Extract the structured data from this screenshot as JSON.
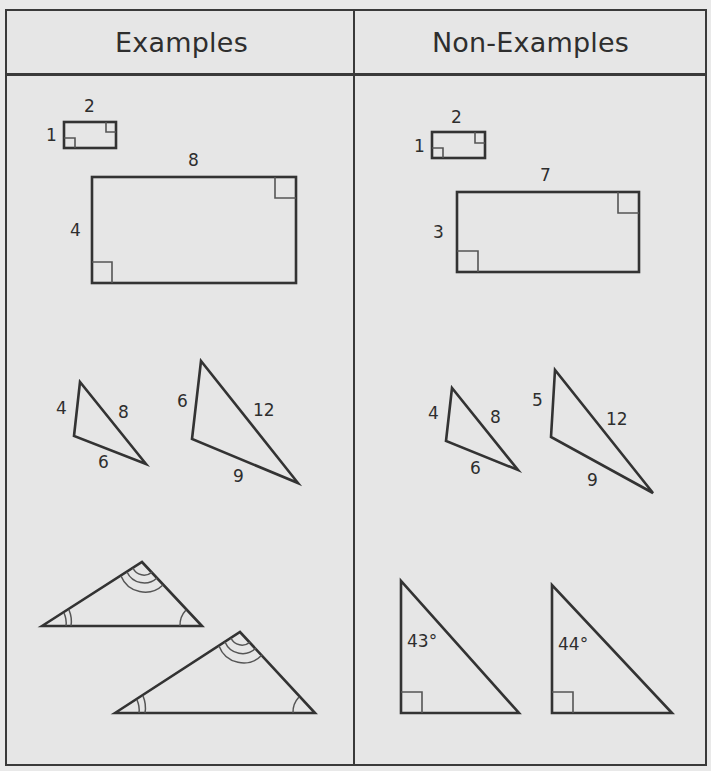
{
  "table": {
    "columns": [
      {
        "label": "Examples"
      },
      {
        "label": "Non-Examples"
      }
    ]
  },
  "examples": {
    "rectangles": [
      {
        "width_label": "2",
        "height_label": "1"
      },
      {
        "width_label": "8",
        "height_label": "4"
      }
    ],
    "triangles": [
      {
        "sides": [
          "4",
          "8",
          "6"
        ]
      },
      {
        "sides": [
          "6",
          "12",
          "9"
        ]
      }
    ],
    "angle_triangles": [
      {
        "description": "triangle with single, double and triple arc angle marks"
      },
      {
        "description": "larger triangle with matching single, double and triple arc angle marks"
      }
    ]
  },
  "non_examples": {
    "rectangles": [
      {
        "width_label": "2",
        "height_label": "1"
      },
      {
        "width_label": "7",
        "height_label": "3"
      }
    ],
    "triangles": [
      {
        "sides": [
          "4",
          "8",
          "6"
        ]
      },
      {
        "sides": [
          "5",
          "12",
          "9"
        ]
      }
    ],
    "right_triangles": [
      {
        "angle_label": "43°"
      },
      {
        "angle_label": "44°"
      }
    ]
  }
}
